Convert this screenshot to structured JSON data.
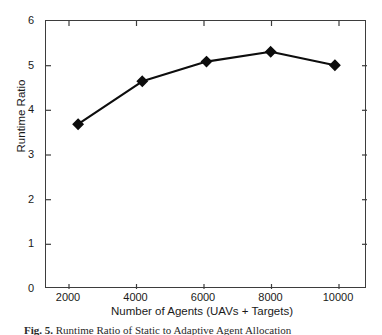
{
  "figure": {
    "caption_label": "Fig. 5.",
    "caption_text": "Runtime Ratio of Static to Adaptive Agent Allocation"
  },
  "axes": {
    "x_title": "Number of Agents (UAVs + Targets)",
    "y_title": "Runtime Ratio",
    "x_ticklabels": [
      "2000",
      "4000",
      "6000",
      "8000",
      "10000"
    ],
    "y_ticklabels": [
      "0",
      "1",
      "2",
      "3",
      "4",
      "5",
      "6"
    ]
  },
  "chart_data": {
    "type": "line",
    "title": "",
    "xlabel": "Number of Agents (UAVs + Targets)",
    "ylabel": "Runtime Ratio",
    "x": [
      2000,
      4000,
      6000,
      8000,
      10000
    ],
    "values": [
      3.69,
      4.65,
      5.09,
      5.31,
      5.01
    ],
    "series": [
      {
        "name": "Runtime Ratio",
        "values": [
          3.69,
          4.65,
          5.09,
          5.31,
          5.01
        ]
      }
    ],
    "xlim": [
      1000,
      11000
    ],
    "ylim": [
      0,
      6
    ],
    "xticks": [
      2000,
      4000,
      6000,
      8000,
      10000
    ],
    "yticks": [
      0,
      1,
      2,
      3,
      4,
      5,
      6
    ],
    "grid": false,
    "legend": "none",
    "marker": "diamond",
    "line_color": "#0d0d0d",
    "marker_color": "#0d0d0d",
    "background": "#ffffff"
  }
}
